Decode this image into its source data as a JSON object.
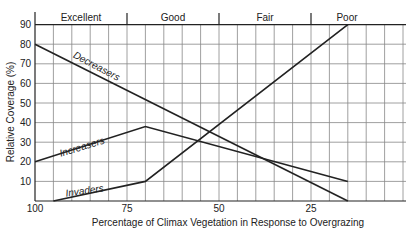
{
  "chart_data": {
    "type": "line",
    "title": "",
    "xlabel": "Percentage of Climax Vegetation in Response to Overgrazing",
    "ylabel": "Relative Coverage (%)",
    "xlim": [
      100,
      0
    ],
    "ylim": [
      0,
      90
    ],
    "x_reversed": true,
    "grid": true,
    "x_ticks": [
      "100",
      "75",
      "50",
      "25"
    ],
    "y_ticks": [
      "10",
      "20",
      "30",
      "40",
      "50",
      "60",
      "70",
      "80",
      "90"
    ],
    "range_condition_bands": [
      {
        "label": "Excellent",
        "from": 100,
        "to": 75
      },
      {
        "label": "Good",
        "from": 75,
        "to": 50
      },
      {
        "label": "Fair",
        "from": 50,
        "to": 25
      },
      {
        "label": "Poor",
        "from": 25,
        "to": 0
      }
    ],
    "series": [
      {
        "name": "Decreasers",
        "x": [
          100,
          15
        ],
        "values": [
          80,
          0
        ]
      },
      {
        "name": "Increasers",
        "x": [
          100,
          70,
          15
        ],
        "values": [
          20,
          38,
          10
        ]
      },
      {
        "name": "Invaders",
        "x": [
          95,
          70,
          15
        ],
        "values": [
          0,
          10,
          90
        ]
      }
    ],
    "legend": "inline labels on lines"
  }
}
